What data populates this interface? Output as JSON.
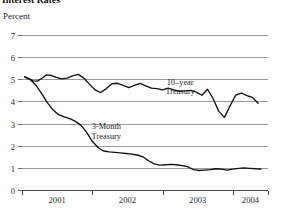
{
  "chart_data": {
    "type": "line",
    "title": "Interest Rates",
    "subtitle": "",
    "ylabel": "Percent",
    "xlabel": "",
    "ylim": [
      0,
      7
    ],
    "xlim": [
      2000.5,
      2004.0
    ],
    "yticks": [
      0,
      1,
      2,
      3,
      4,
      5,
      6,
      7
    ],
    "ytick_labels": [
      "0",
      "1",
      "2",
      "3",
      "4",
      "5",
      "6",
      "7"
    ],
    "xticks": [
      2000.5,
      2001.5,
      2002.5,
      2003.5,
      2004.0
    ],
    "xtick_labels": [
      "2001",
      "2002",
      "2003",
      "2004"
    ],
    "grid": "horizontal",
    "legend_position": "inline-annotation",
    "annotations": [
      {
        "text": "10-year Treasury",
        "line1": "10–year",
        "line2": "Treasury",
        "x": 2002.75,
        "y": 4.75
      },
      {
        "text": "3-Month Treasury",
        "line1": "3-Month",
        "line2": "Treasury",
        "x": 2001.7,
        "y": 2.75
      }
    ],
    "series": [
      {
        "name": "10-year Treasury",
        "color": "#111111",
        "x": [
          2000.54,
          2000.6,
          2000.66,
          2000.72,
          2000.79,
          2000.85,
          2000.92,
          2000.98,
          2001.06,
          2001.14,
          2001.22,
          2001.3,
          2001.38,
          2001.46,
          2001.54,
          2001.62,
          2001.7,
          2001.78,
          2001.86,
          2001.94,
          2002.02,
          2002.1,
          2002.18,
          2002.26,
          2002.34,
          2002.42,
          2002.5,
          2002.58,
          2002.66,
          2002.74,
          2002.82,
          2002.9,
          2002.98,
          2003.06,
          2003.14,
          2003.22,
          2003.3,
          2003.38,
          2003.46,
          2003.54,
          2003.62,
          2003.7,
          2003.78
        ],
        "values": [
          5.12,
          5.02,
          4.93,
          4.92,
          5.06,
          5.2,
          5.17,
          5.1,
          5.02,
          5.05,
          5.15,
          5.22,
          5.05,
          4.78,
          4.52,
          4.4,
          4.58,
          4.8,
          4.82,
          4.72,
          4.62,
          4.72,
          4.82,
          4.7,
          4.6,
          4.58,
          4.52,
          4.6,
          4.52,
          4.46,
          4.48,
          4.5,
          4.42,
          4.28,
          4.55,
          4.12,
          3.55,
          3.28,
          3.8,
          4.28,
          4.38,
          4.26,
          4.18
        ],
        "end_value": 3.92
      },
      {
        "name": "3-Month Treasury",
        "color": "#111111",
        "x": [
          2000.54,
          2000.62,
          2000.7,
          2000.78,
          2000.86,
          2000.94,
          2001.02,
          2001.1,
          2001.18,
          2001.26,
          2001.34,
          2001.42,
          2001.5,
          2001.58,
          2001.66,
          2001.74,
          2001.82,
          2001.9,
          2001.98,
          2002.06,
          2002.14,
          2002.22,
          2002.3,
          2002.38,
          2002.46,
          2002.54,
          2002.62,
          2002.7,
          2002.78,
          2002.86,
          2002.94,
          2003.02,
          2003.1,
          2003.18,
          2003.26,
          2003.34,
          2003.42,
          2003.5,
          2003.58,
          2003.66,
          2003.74,
          2003.82
        ],
        "values": [
          5.1,
          4.98,
          4.72,
          4.35,
          3.95,
          3.62,
          3.4,
          3.3,
          3.22,
          3.1,
          2.92,
          2.6,
          2.2,
          1.92,
          1.76,
          1.72,
          1.7,
          1.68,
          1.65,
          1.62,
          1.58,
          1.5,
          1.32,
          1.18,
          1.12,
          1.14,
          1.16,
          1.14,
          1.1,
          1.05,
          0.92,
          0.88,
          0.9,
          0.92,
          0.96,
          0.94,
          0.9,
          0.94,
          0.98,
          1.0,
          0.98,
          0.96
        ],
        "end_value": 0.95
      }
    ]
  }
}
